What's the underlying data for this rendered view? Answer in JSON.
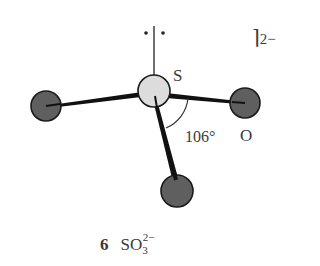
{
  "diagram": {
    "type": "molecular-structure",
    "molecule": "SO3 2- (sulfite ion)",
    "colors": {
      "background": "#ffffff",
      "central_atom_fill": "#dcdcdc",
      "outer_atom_fill": "#5f5f5f",
      "bond": "#111111",
      "text": "#3a3a3a"
    },
    "atoms": [
      {
        "id": "S",
        "cx": 154,
        "cy": 91,
        "r": 16,
        "role": "central"
      },
      {
        "id": "O-left",
        "cx": 46,
        "cy": 106,
        "r": 15,
        "role": "outer"
      },
      {
        "id": "O-right",
        "cx": 245,
        "cy": 103,
        "r": 15,
        "role": "outer"
      },
      {
        "id": "O-bottom",
        "cx": 177,
        "cy": 191,
        "r": 16,
        "role": "outer"
      }
    ],
    "lone_pair": {
      "dots": "• •"
    },
    "labels": {
      "central_atom": "S",
      "outer_atom": "O",
      "bond_angle": "106°",
      "charge_bracket": "⌉",
      "charge": "2−"
    },
    "caption": {
      "number": "6",
      "formula_main": "SO",
      "formula_subscript": "3",
      "formula_superscript": "2−"
    }
  }
}
